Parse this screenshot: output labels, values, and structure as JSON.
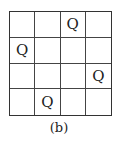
{
  "board": {
    "size": 4,
    "rows": [
      [
        "",
        "",
        "Q",
        ""
      ],
      [
        "Q",
        "",
        "",
        ""
      ],
      [
        "",
        "",
        "",
        "Q"
      ],
      [
        "",
        "Q",
        "",
        ""
      ]
    ]
  },
  "caption": "(b)"
}
